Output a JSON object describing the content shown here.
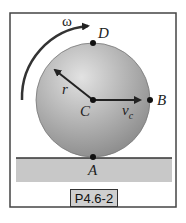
{
  "figure": {
    "caption": "P4.6-2",
    "labels": {
      "omega": "ω",
      "D": "D",
      "B": "B",
      "C": "C",
      "A": "A",
      "r": "r",
      "vc_v": "v",
      "vc_sub": "c"
    },
    "colors": {
      "frame": "#444444",
      "ground": "#c8c8c8",
      "disk_light": "#d9d9d9",
      "disk_dark": "#8f8f8f",
      "ink": "#222222"
    }
  }
}
